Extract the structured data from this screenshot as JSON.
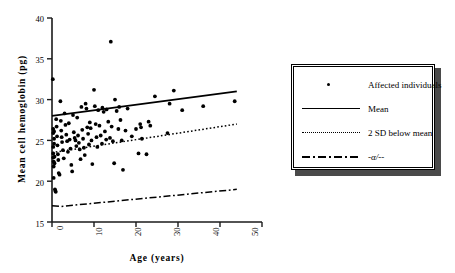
{
  "chart_data": {
    "type": "scatter",
    "title": "",
    "xlabel": "Age  (years)",
    "ylabel": "Mean  cell  hemoglobin  (pg)",
    "xlim": [
      0,
      50
    ],
    "ylim": [
      15,
      40
    ],
    "xticks": [
      0,
      10,
      20,
      30,
      40,
      50
    ],
    "xtick_labels": [
      "0",
      "10",
      "20",
      "30",
      "40",
      "50"
    ],
    "yticks": [
      15,
      20,
      25,
      30,
      35,
      40
    ],
    "ytick_labels": [
      "15",
      "20",
      "25",
      "30",
      "35",
      "40"
    ],
    "grid": false,
    "legend_position": "right",
    "series": [
      {
        "name": "Affected individuals",
        "type": "scatter",
        "marker": "filled-circle",
        "color": "#000000",
        "points": [
          [
            0.2,
            32.5
          ],
          [
            0.3,
            26.4
          ],
          [
            0.3,
            25.9
          ],
          [
            0.3,
            24.2
          ],
          [
            0.3,
            23.4
          ],
          [
            0.3,
            22.9
          ],
          [
            0.4,
            22.4
          ],
          [
            0.4,
            21.8
          ],
          [
            0.4,
            20.4
          ],
          [
            0.5,
            26.1
          ],
          [
            0.5,
            25.2
          ],
          [
            0.5,
            24.6
          ],
          [
            0.6,
            23.0
          ],
          [
            0.6,
            22.2
          ],
          [
            0.7,
            19.0
          ],
          [
            0.8,
            18.8
          ],
          [
            0.9,
            18.7
          ],
          [
            1.0,
            27.6
          ],
          [
            1.1,
            26.7
          ],
          [
            1.2,
            25.5
          ],
          [
            1.3,
            24.4
          ],
          [
            1.4,
            23.3
          ],
          [
            1.5,
            22.6
          ],
          [
            1.6,
            21.0
          ],
          [
            1.8,
            20.8
          ],
          [
            2.0,
            29.8
          ],
          [
            2.1,
            27.4
          ],
          [
            2.2,
            26.2
          ],
          [
            2.3,
            25.4
          ],
          [
            2.4,
            24.8
          ],
          [
            2.6,
            23.8
          ],
          [
            2.8,
            22.8
          ],
          [
            3.0,
            28.3
          ],
          [
            3.2,
            26.9
          ],
          [
            3.4,
            25.7
          ],
          [
            3.6,
            24.9
          ],
          [
            3.8,
            23.6
          ],
          [
            4.0,
            27.1
          ],
          [
            4.2,
            25.1
          ],
          [
            4.4,
            24.0
          ],
          [
            4.6,
            22.0
          ],
          [
            4.8,
            21.2
          ],
          [
            5.0,
            28.1
          ],
          [
            5.2,
            26.0
          ],
          [
            5.4,
            25.3
          ],
          [
            5.6,
            25.0
          ],
          [
            5.8,
            24.3
          ],
          [
            6.0,
            27.8
          ],
          [
            6.2,
            25.6
          ],
          [
            6.4,
            24.7
          ],
          [
            6.6,
            23.9
          ],
          [
            6.8,
            22.7
          ],
          [
            7.0,
            29.1
          ],
          [
            7.2,
            26.3
          ],
          [
            7.4,
            25.2
          ],
          [
            7.6,
            24.1
          ],
          [
            7.8,
            23.2
          ],
          [
            8.0,
            29.5
          ],
          [
            8.2,
            28.9
          ],
          [
            8.4,
            26.6
          ],
          [
            8.6,
            25.8
          ],
          [
            8.8,
            24.5
          ],
          [
            9.0,
            27.2
          ],
          [
            9.2,
            26.5
          ],
          [
            9.4,
            25.0
          ],
          [
            9.6,
            22.1
          ],
          [
            10.0,
            31.2
          ],
          [
            10.2,
            29.2
          ],
          [
            10.4,
            27.0
          ],
          [
            10.6,
            25.4
          ],
          [
            10.8,
            24.2
          ],
          [
            11.0,
            28.7
          ],
          [
            11.3,
            26.8
          ],
          [
            11.6,
            25.6
          ],
          [
            11.9,
            24.6
          ],
          [
            12.0,
            29.0
          ],
          [
            12.3,
            28.5
          ],
          [
            12.6,
            26.1
          ],
          [
            12.9,
            25.1
          ],
          [
            13.0,
            28.8
          ],
          [
            13.4,
            27.3
          ],
          [
            13.8,
            25.3
          ],
          [
            14.0,
            37.1
          ],
          [
            14.2,
            26.7
          ],
          [
            14.5,
            24.9
          ],
          [
            14.8,
            22.2
          ],
          [
            15.0,
            30.0
          ],
          [
            15.4,
            28.6
          ],
          [
            15.8,
            26.4
          ],
          [
            16.0,
            29.1
          ],
          [
            16.3,
            27.5
          ],
          [
            16.6,
            25.0
          ],
          [
            16.9,
            21.4
          ],
          [
            17.5,
            26.2
          ],
          [
            18.0,
            28.9
          ],
          [
            19.0,
            25.5
          ],
          [
            20.0,
            26.4
          ],
          [
            20.6,
            23.4
          ],
          [
            21.0,
            27.0
          ],
          [
            21.2,
            26.6
          ],
          [
            21.4,
            25.2
          ],
          [
            22.5,
            23.3
          ],
          [
            23.0,
            27.3
          ],
          [
            23.4,
            26.8
          ],
          [
            24.5,
            30.4
          ],
          [
            27.5,
            25.9
          ],
          [
            28.0,
            29.5
          ],
          [
            29.0,
            31.1
          ],
          [
            31.0,
            28.7
          ],
          [
            36.0,
            29.2
          ],
          [
            43.5,
            29.8
          ]
        ]
      },
      {
        "name": "Mean",
        "type": "line",
        "style": "solid",
        "color": "#000000",
        "x": [
          0,
          44
        ],
        "y": [
          28.0,
          31.0
        ]
      },
      {
        "name": "2 SD below mean",
        "type": "line",
        "style": "dotted",
        "color": "#000000",
        "x": [
          0,
          44
        ],
        "y": [
          23.5,
          27.0
        ]
      },
      {
        "name": "-α/--",
        "type": "line",
        "style": "dash-dot",
        "color": "#000000",
        "x": [
          0,
          2,
          44
        ],
        "y": [
          17.0,
          16.9,
          19.0
        ]
      }
    ]
  },
  "legend": {
    "entries": [
      {
        "label": "Affected individuals",
        "key": "marker-dot"
      },
      {
        "label": "Mean",
        "key": "line-solid"
      },
      {
        "label": "2 SD below mean",
        "key": "line-dotted"
      },
      {
        "label": "-α/--",
        "key": "line-dashdot"
      }
    ]
  },
  "axes": {
    "y_title": "Mean  cell  hemoglobin  (pg)",
    "x_title": "Age  (years)"
  }
}
